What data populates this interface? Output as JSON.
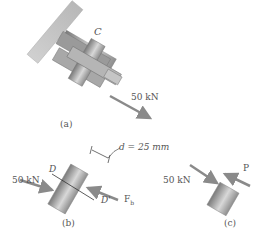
{
  "figure": {
    "panel_a": {
      "caption": "(a)",
      "label_C": "C",
      "force": "50 kN"
    },
    "panel_b": {
      "caption": "(b)",
      "dimension": "d = 25 mm",
      "force_left": "50 kN",
      "force_right": "F",
      "force_right_subscript": "b",
      "plane_top": "D",
      "plane_bottom": "D'"
    },
    "panel_c": {
      "caption": "(c)",
      "force_left": "50 kN",
      "force_right": "P"
    },
    "colors": {
      "arrow": "#8a8a8a",
      "cylinder_dark": "#7a7a7a",
      "cylinder_light": "#d8d8d8",
      "text": "#555555"
    }
  }
}
